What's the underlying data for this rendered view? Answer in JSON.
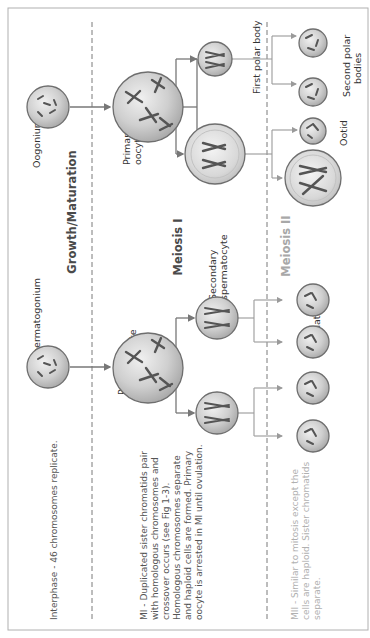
{
  "figure": {
    "orientation": "rotated 90deg counter-clockwise; text reads bottom-to-top",
    "phases": {
      "growth": "Growth/Maturation",
      "meiosis1": "Meiosis I",
      "meiosis2": "Meiosis II"
    },
    "notes": {
      "interphase": "Interphase - 46 chromosomes replicate.",
      "mi": [
        "MI - Duplicated sister chromatids pair",
        "with homologous chromosomes and",
        "crossover occurs (see Fig 1-3).",
        "Homologous chromosomes separate",
        "and haploid cells are formed. Primary",
        "oocyte is arrested in MI until ovulation."
      ],
      "mii": [
        "MII - Similar to mitosis except the",
        "cells are haploid. Sister chromatids",
        "separate."
      ]
    },
    "oogenesis": {
      "oogonium": "Oogonium",
      "primary_oocyte": [
        "Primary",
        "oocyte"
      ],
      "first_polar_body": "First polar body",
      "second_polar_bodies": [
        "Second polar",
        "bodies"
      ],
      "ootid": "Ootid"
    },
    "spermatogenesis": {
      "spermatogonium": "Spermatogonium",
      "primary_spermatocyte": [
        "Primary",
        "spermatocyte"
      ],
      "secondary_spermatocyte": [
        "Secondary",
        "spermatocyte"
      ],
      "spermatids": "Spermatids"
    },
    "colors": {
      "cell_fill": "#c8c8c8",
      "cell_stroke": "#6e6e6e",
      "chromosome": "#555555",
      "dashed_line": "#7a7a7a",
      "border": "#b0b0b0",
      "muted_text": "#a8a8a8"
    }
  }
}
